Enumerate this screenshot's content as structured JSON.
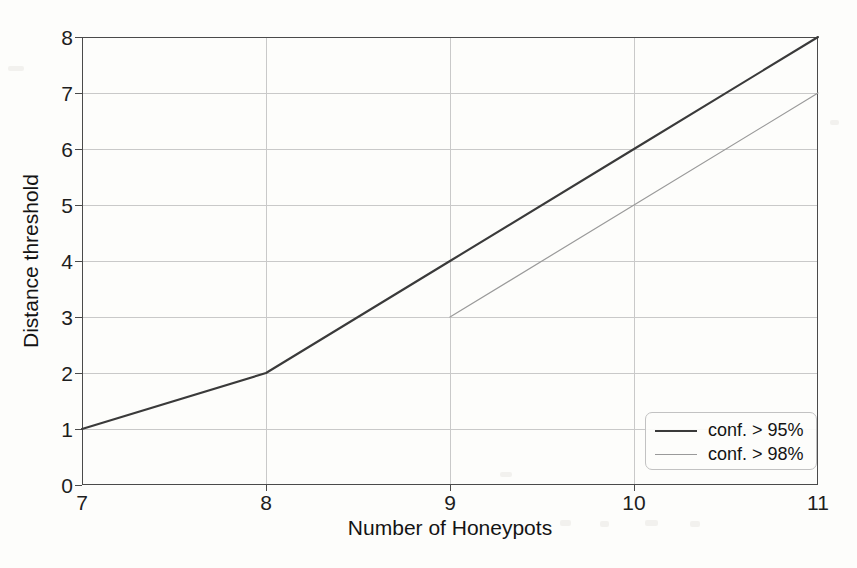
{
  "chart_data": {
    "type": "line",
    "title": "",
    "xlabel": "Number of Honeypots",
    "ylabel": "Distance threshold",
    "xlim": [
      7,
      11
    ],
    "ylim": [
      0,
      8
    ],
    "xticks": [
      "7",
      "8",
      "9",
      "10",
      "11"
    ],
    "yticks": [
      "0",
      "1",
      "2",
      "3",
      "4",
      "5",
      "6",
      "7",
      "8"
    ],
    "grid": true,
    "legend_position": "lower right",
    "series": [
      {
        "name": "conf. > 95%",
        "color": "#3a3a3a",
        "width": 2.1,
        "x": [
          7,
          8,
          9,
          10,
          11
        ],
        "values": [
          1,
          2,
          4,
          6,
          8
        ]
      },
      {
        "name": "conf. > 98%",
        "color": "#9a9a9a",
        "width": 1.2,
        "x": [
          9,
          10,
          11
        ],
        "values": [
          3,
          5,
          7
        ]
      }
    ]
  },
  "legend": {
    "items": [
      {
        "label": "conf. > 95%"
      },
      {
        "label": "conf. > 98%"
      }
    ]
  }
}
